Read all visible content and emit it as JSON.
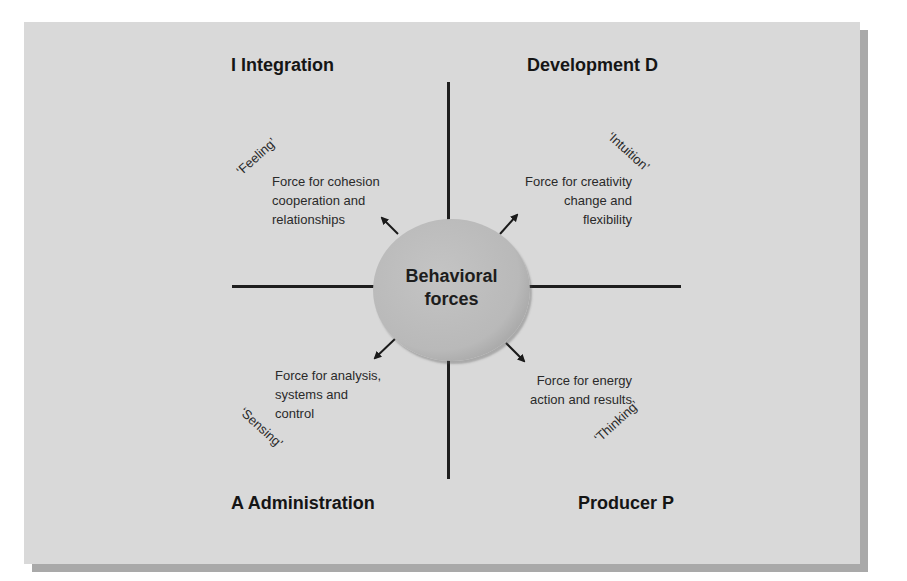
{
  "diagram": {
    "center": {
      "label": "Behavioral\nforces"
    },
    "quadrants": [
      {
        "id": "integration",
        "heading": "I Integration",
        "mode": "‘Feeling’",
        "description": "Force for cohesion\ncooperation and\nrelationships",
        "position": "top-left"
      },
      {
        "id": "development",
        "heading": "Development  D",
        "mode": "‘Intuition’",
        "description": "Force for creativity\nchange and\nflexibility",
        "position": "top-right"
      },
      {
        "id": "administration",
        "heading": "A Administration",
        "mode": "‘Sensing’",
        "description": "Force for analysis,\nsystems and\ncontrol",
        "position": "bottom-left"
      },
      {
        "id": "producer",
        "heading": "Producer P",
        "mode": "‘Thinking’",
        "description": "Force for energy\naction and results",
        "position": "bottom-right"
      }
    ],
    "colors": {
      "panel": "#d9d9d9",
      "panel_shadow": "#a9a9a9",
      "circle": "#bdbdbd",
      "lines": "#1e1e1e"
    }
  }
}
